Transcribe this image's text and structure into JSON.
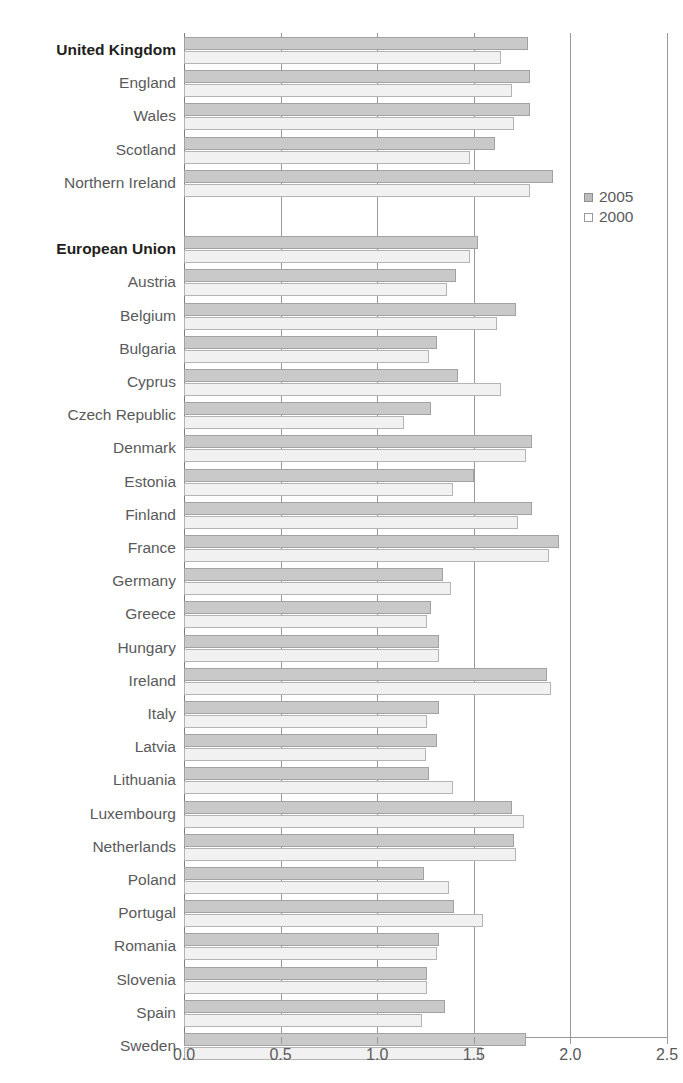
{
  "chart_data": {
    "type": "bar",
    "orientation": "horizontal",
    "title": "",
    "xlabel": "",
    "ylabel": "",
    "xlim": [
      0.0,
      2.5
    ],
    "xticks": [
      "0.0",
      "0.5",
      "1.0",
      "1.5",
      "2.0",
      "2.5"
    ],
    "xtick_values": [
      0.0,
      0.5,
      1.0,
      1.5,
      2.0,
      2.5
    ],
    "grid": "vertical",
    "legend_position": "right",
    "legend": [
      {
        "name": "2005",
        "swatch": "filled-gray"
      },
      {
        "name": "2000",
        "swatch": "white"
      }
    ],
    "series": [
      {
        "name": "2005",
        "color": "#c9c9c9"
      },
      {
        "name": "2000",
        "color": "#f1f1f1"
      }
    ],
    "groups": [
      {
        "rows": [
          {
            "label": "United Kingdom",
            "bold": true,
            "v2005": 1.78,
            "v2000": 1.64
          },
          {
            "label": "England",
            "bold": false,
            "v2005": 1.79,
            "v2000": 1.7
          },
          {
            "label": "Wales",
            "bold": false,
            "v2005": 1.79,
            "v2000": 1.71
          },
          {
            "label": "Scotland",
            "bold": false,
            "v2005": 1.61,
            "v2000": 1.48
          },
          {
            "label": "Northern Ireland",
            "bold": false,
            "v2005": 1.91,
            "v2000": 1.79
          }
        ]
      },
      {
        "rows": [
          {
            "label": "European Union",
            "bold": true,
            "v2005": 1.52,
            "v2000": 1.48
          },
          {
            "label": "Austria",
            "bold": false,
            "v2005": 1.41,
            "v2000": 1.36
          },
          {
            "label": "Belgium",
            "bold": false,
            "v2005": 1.72,
            "v2000": 1.62
          },
          {
            "label": "Bulgaria",
            "bold": false,
            "v2005": 1.31,
            "v2000": 1.27
          },
          {
            "label": "Cyprus",
            "bold": false,
            "v2005": 1.42,
            "v2000": 1.64
          },
          {
            "label": "Czech Republic",
            "bold": false,
            "v2005": 1.28,
            "v2000": 1.14
          },
          {
            "label": "Denmark",
            "bold": false,
            "v2005": 1.8,
            "v2000": 1.77
          },
          {
            "label": "Estonia",
            "bold": false,
            "v2005": 1.5,
            "v2000": 1.39
          },
          {
            "label": "Finland",
            "bold": false,
            "v2005": 1.8,
            "v2000": 1.73
          },
          {
            "label": "France",
            "bold": false,
            "v2005": 1.94,
            "v2000": 1.89
          },
          {
            "label": "Germany",
            "bold": false,
            "v2005": 1.34,
            "v2000": 1.38
          },
          {
            "label": "Greece",
            "bold": false,
            "v2005": 1.28,
            "v2000": 1.26
          },
          {
            "label": "Hungary",
            "bold": false,
            "v2005": 1.32,
            "v2000": 1.32
          },
          {
            "label": "Ireland",
            "bold": false,
            "v2005": 1.88,
            "v2000": 1.9
          },
          {
            "label": "Italy",
            "bold": false,
            "v2005": 1.32,
            "v2000": 1.26
          },
          {
            "label": "Latvia",
            "bold": false,
            "v2005": 1.31,
            "v2000": 1.25
          },
          {
            "label": "Lithuania",
            "bold": false,
            "v2005": 1.27,
            "v2000": 1.39
          },
          {
            "label": "Luxembourg",
            "bold": false,
            "v2005": 1.7,
            "v2000": 1.76
          },
          {
            "label": "Netherlands",
            "bold": false,
            "v2005": 1.71,
            "v2000": 1.72
          },
          {
            "label": "Poland",
            "bold": false,
            "v2005": 1.24,
            "v2000": 1.37
          },
          {
            "label": "Portugal",
            "bold": false,
            "v2005": 1.4,
            "v2000": 1.55
          },
          {
            "label": "Romania",
            "bold": false,
            "v2005": 1.32,
            "v2000": 1.31
          },
          {
            "label": "Slovenia",
            "bold": false,
            "v2005": 1.26,
            "v2000": 1.26
          },
          {
            "label": "Spain",
            "bold": false,
            "v2005": 1.35,
            "v2000": 1.23
          },
          {
            "label": "Sweden",
            "bold": false,
            "v2005": 1.77,
            "v2000": 1.54
          }
        ]
      }
    ]
  }
}
